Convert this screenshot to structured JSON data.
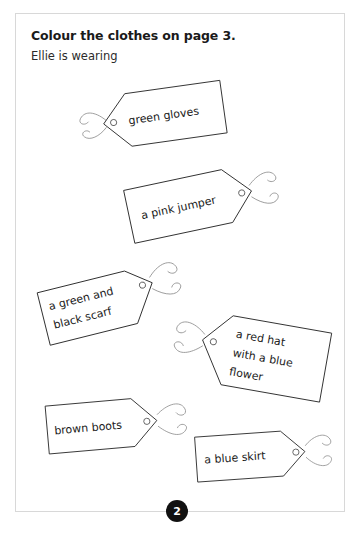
{
  "page": {
    "title": "Colour the clothes on page 3.",
    "subtitle": "Ellie is wearing",
    "number": "2",
    "background_color": "#ffffff",
    "border_color": "#d8d8d8",
    "ink_color": "#1a1a1a",
    "string_color": "#8e8e8e",
    "badge_color": "#111111"
  },
  "tags": [
    {
      "id": "green-gloves",
      "lines": [
        "green gloves"
      ],
      "point_direction": "left",
      "rotation_deg": -8
    },
    {
      "id": "pink-jumper",
      "lines": [
        "a pink jumper"
      ],
      "point_direction": "right",
      "rotation_deg": -12
    },
    {
      "id": "green-and-black-scarf",
      "lines": [
        "a green and",
        "black scarf"
      ],
      "point_direction": "right",
      "rotation_deg": -14
    },
    {
      "id": "red-hat-blue-flower",
      "lines": [
        "a red hat",
        "with a blue",
        "flower"
      ],
      "point_direction": "left",
      "rotation_deg": 10
    },
    {
      "id": "brown-boots",
      "lines": [
        "brown boots"
      ],
      "point_direction": "right",
      "rotation_deg": -5
    },
    {
      "id": "blue-skirt",
      "lines": [
        "a blue skirt"
      ],
      "point_direction": "right",
      "rotation_deg": -4
    }
  ]
}
